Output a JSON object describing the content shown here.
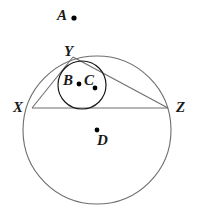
{
  "figure": {
    "type": "geometry-diagram",
    "background_color": "#ffffff",
    "stroke_color": "#6e6e6e",
    "label_color": "#1a1a1a",
    "point_color": "#000000",
    "width": 198,
    "height": 219
  },
  "labels": {
    "A": "A",
    "B": "B",
    "C": "C",
    "D": "D",
    "X": "X",
    "Y": "Y",
    "Z": "Z"
  },
  "points": [
    {
      "name": "A",
      "label": "A",
      "x": 74,
      "y": 18,
      "marked": true
    },
    {
      "name": "B",
      "label": "B",
      "x": 79,
      "y": 84,
      "marked": true
    },
    {
      "name": "C",
      "label": "C",
      "x": 95,
      "y": 88,
      "marked": true
    },
    {
      "name": "D",
      "label": "D",
      "x": 97,
      "y": 130,
      "marked": true
    },
    {
      "name": "X",
      "label": "X",
      "x": 32,
      "y": 108,
      "marked": false
    },
    {
      "name": "Y",
      "label": "Y",
      "x": 73,
      "y": 57,
      "marked": false
    },
    {
      "name": "Z",
      "label": "Z",
      "x": 168,
      "y": 108,
      "marked": false
    }
  ],
  "circles": [
    {
      "name": "circumcircle",
      "center_label": "D",
      "cx": 97,
      "cy": 130,
      "r": 74
    },
    {
      "name": "incircle",
      "center_label": "C",
      "cx": 82,
      "cy": 85,
      "r": 24
    }
  ],
  "triangle": {
    "name": "triangle-xyz",
    "vertices": [
      "X",
      "Y",
      "Z"
    ],
    "sides": [
      {
        "name": "side-xy",
        "from": "X",
        "to": "Y"
      },
      {
        "name": "side-yz",
        "from": "Y",
        "to": "Z"
      },
      {
        "name": "side-xz",
        "from": "X",
        "to": "Z"
      }
    ]
  }
}
